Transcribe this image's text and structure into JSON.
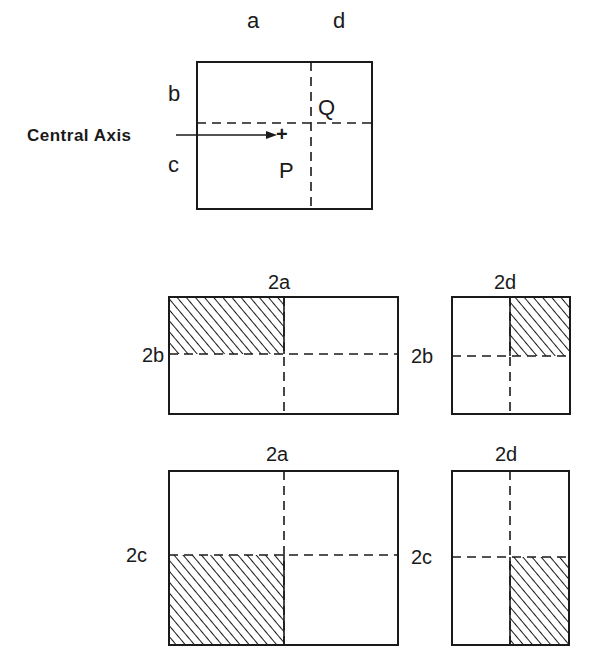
{
  "top_diagram": {
    "labels": {
      "a": "a",
      "d": "d",
      "b": "b",
      "c": "c",
      "Q": "Q",
      "P": "P"
    },
    "central_axis_label": "Central Axis",
    "central_axis_marker": "+"
  },
  "sub_diagrams": [
    {
      "id": "2a-2b",
      "top_label": "2a",
      "side_label": "2b",
      "hatched_quadrant": "top-left"
    },
    {
      "id": "2d-2b",
      "top_label": "2d",
      "side_label": "2b",
      "hatched_quadrant": "top-right"
    },
    {
      "id": "2a-2c",
      "top_label": "2a",
      "side_label": "2c",
      "hatched_quadrant": "bottom-left"
    },
    {
      "id": "2d-2c",
      "top_label": "2d",
      "side_label": "2c",
      "hatched_quadrant": "bottom-right"
    }
  ],
  "colors": {
    "line": "#1a1a1a",
    "background": "#ffffff"
  }
}
